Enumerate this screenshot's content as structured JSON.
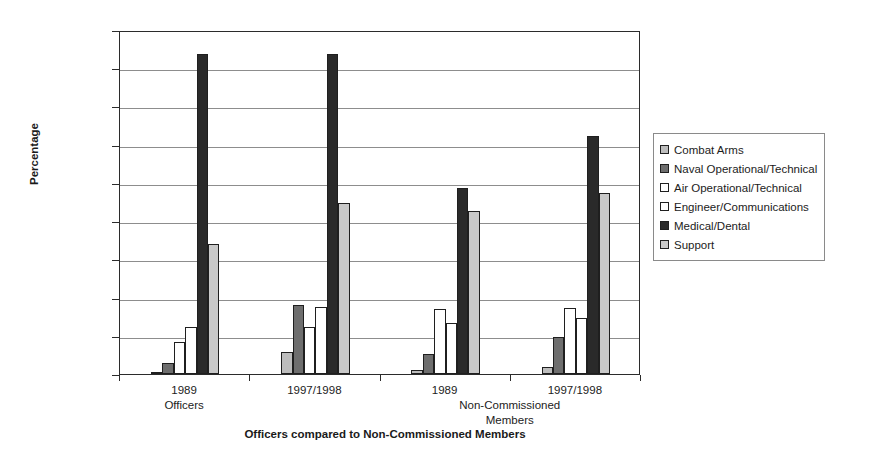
{
  "chart_data": {
    "type": "bar",
    "title": "",
    "xlabel": "Officers compared to Non-Commissioned Members",
    "ylabel": "Percentage",
    "ylim": [
      0,
      45
    ],
    "ytick_labels": [
      "0.00%",
      "5.00%",
      "10.00%",
      "15.00%",
      "20.00%",
      "25.00%",
      "30.00%",
      "35.00%",
      "40.00%",
      "45.00%"
    ],
    "ytick_values": [
      0,
      5,
      10,
      15,
      20,
      25,
      30,
      35,
      40,
      45
    ],
    "grid": true,
    "legend_position": "right",
    "categories": [
      "1989",
      "1997/1998",
      "1989",
      "1997/1998"
    ],
    "group_labels": [
      "Officers",
      "Non-Commissioned Members"
    ],
    "group_label_lines": [
      [
        "Officers"
      ],
      [
        "Non-Commissioned",
        "Members"
      ]
    ],
    "series": [
      {
        "name": "Combat Arms",
        "color": "#bdbdbd",
        "values": [
          0.3,
          2.9,
          0.5,
          0.9
        ]
      },
      {
        "name": "Naval Operational/Technical",
        "color": "#6e6e6e",
        "values": [
          1.5,
          9.0,
          2.6,
          4.9
        ]
      },
      {
        "name": "Air Operational/Technical",
        "color": "#ffffff",
        "values": [
          4.2,
          6.2,
          8.5,
          8.7
        ]
      },
      {
        "name": "Engineer/Communications",
        "color": "#ffffff",
        "values": [
          6.2,
          8.8,
          6.7,
          7.3
        ]
      },
      {
        "name": "Medical/Dental",
        "color": "#2a2a2a",
        "values": [
          41.8,
          41.8,
          24.3,
          31.2
        ]
      },
      {
        "name": "Support",
        "color": "#c9c9c9",
        "values": [
          17.0,
          22.4,
          21.3,
          23.7
        ]
      }
    ]
  },
  "axes": {
    "y_title": "Percentage",
    "x_title": "Officers compared to Non-Commissioned Members"
  }
}
